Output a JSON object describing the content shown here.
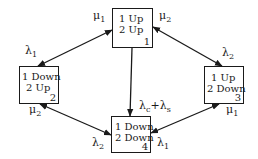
{
  "diagram": {
    "type": "state-transition",
    "states": [
      {
        "id": "1",
        "line1": "1 Up",
        "line2": "2 Up",
        "number": "1"
      },
      {
        "id": "2",
        "line1": "1 Down",
        "line2": "2 Up",
        "number": "2"
      },
      {
        "id": "3",
        "line1": "1 Up",
        "line2": "2 Down",
        "number": "3"
      },
      {
        "id": "4",
        "line1": "1 Down",
        "line2": "2 Down",
        "number": "4"
      }
    ],
    "labels": {
      "mu1_top": {
        "sym": "μ",
        "sub": "1"
      },
      "mu2_top": {
        "sym": "μ",
        "sub": "2"
      },
      "lambda1_left": {
        "sym": "λ",
        "sub": "1"
      },
      "lambda2_right": {
        "sym": "λ",
        "sub": "2"
      },
      "mu2_bottom_left": {
        "sym": "μ",
        "sub": "2"
      },
      "mu1_bottom_right": {
        "sym": "μ",
        "sub": "1"
      },
      "lambda2_bottom": {
        "sym": "λ",
        "sub": "2"
      },
      "lambda1_bottom": {
        "sym": "λ",
        "sub": "1"
      },
      "common_cause": {
        "text": "λ",
        "sub1": "c",
        "plus": "+λ",
        "sub2": "s"
      }
    },
    "edges": [
      {
        "from": "1",
        "to": "2",
        "bidirectional": true,
        "rates": [
          "λ1",
          "μ1"
        ]
      },
      {
        "from": "1",
        "to": "3",
        "bidirectional": true,
        "rates": [
          "λ2",
          "μ2"
        ]
      },
      {
        "from": "1",
        "to": "4",
        "bidirectional": false,
        "rates": [
          "λc+λs"
        ]
      },
      {
        "from": "2",
        "to": "4",
        "bidirectional": true,
        "rates": [
          "λ2",
          "μ2"
        ]
      },
      {
        "from": "3",
        "to": "4",
        "bidirectional": true,
        "rates": [
          "λ1",
          "μ1"
        ]
      }
    ]
  }
}
